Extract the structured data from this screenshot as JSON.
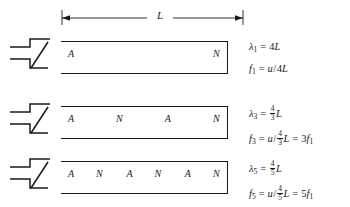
{
  "figure": {
    "dimension": {
      "label": "L",
      "name": "pipe-length-dimension"
    },
    "rows": [
      {
        "id": "harmonic-1",
        "node_labels": [
          {
            "text": "A",
            "pos_pct": 6
          },
          {
            "text": "N",
            "pos_pct": 93
          }
        ],
        "lambda": {
          "symbol": "λ",
          "subscript": "1",
          "equals": "=",
          "value_prefix": "4",
          "value_unit": "L"
        },
        "frequency": {
          "symbol": "f",
          "subscript": "1",
          "equals": "=",
          "speed": "u",
          "slash": "/",
          "denom_prefix": "4",
          "denom_unit": "L",
          "relation": "",
          "relation_value": ""
        }
      },
      {
        "id": "harmonic-3",
        "node_labels": [
          {
            "text": "A",
            "pos_pct": 6
          },
          {
            "text": "N",
            "pos_pct": 35
          },
          {
            "text": "A",
            "pos_pct": 64
          },
          {
            "text": "N",
            "pos_pct": 93
          }
        ],
        "lambda": {
          "symbol": "λ",
          "subscript": "3",
          "equals": "=",
          "frac_num": "4",
          "frac_den": "3",
          "value_unit": "L"
        },
        "frequency": {
          "symbol": "f",
          "subscript": "3",
          "equals": "=",
          "speed": "u",
          "slash": "/",
          "frac_num": "4",
          "frac_den": "3",
          "denom_unit": "L",
          "relation": "=",
          "relation_value": "3",
          "relation_symbol": "f",
          "relation_subscript": "1"
        }
      },
      {
        "id": "harmonic-5",
        "node_labels": [
          {
            "text": "A",
            "pos_pct": 6
          },
          {
            "text": "N",
            "pos_pct": 23
          },
          {
            "text": "A",
            "pos_pct": 41
          },
          {
            "text": "N",
            "pos_pct": 58
          },
          {
            "text": "A",
            "pos_pct": 76
          },
          {
            "text": "N",
            "pos_pct": 93
          }
        ],
        "lambda": {
          "symbol": "λ",
          "subscript": "5",
          "equals": "=",
          "frac_num": "4",
          "frac_den": "5",
          "value_unit": "L"
        },
        "frequency": {
          "symbol": "f",
          "subscript": "5",
          "equals": "=",
          "speed": "u",
          "slash": "/",
          "frac_num": "4",
          "frac_den": "5",
          "denom_unit": "L",
          "relation": "=",
          "relation_value": "5",
          "relation_symbol": "f",
          "relation_subscript": "1"
        }
      }
    ],
    "colors": {
      "ink": "#1a1a1a",
      "background": "#ffffff"
    }
  }
}
